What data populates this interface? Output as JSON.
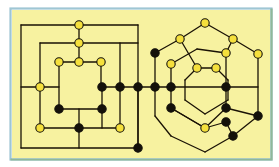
{
  "figure": {
    "background_color": "#f7f2a0",
    "outer_background_color": "#ffffff",
    "border_top_color": "#9fc6d4",
    "border_left_color": "#9fc6d4",
    "border_right_color": "#8fb89a",
    "border_bottom_color": "#8fb89a",
    "edge_color": "#1a1205",
    "edge_width": 1.3,
    "node_open_fill": "#f5e03c",
    "node_filled_fill": "#14110a",
    "node_stroke": "#14110a",
    "node_radius": 4.2,
    "node_stroke_width": 1.1,
    "plot_area": {
      "x": 12,
      "y": 10,
      "width": 258,
      "height": 148
    }
  },
  "chart_data": {
    "type": "diagram",
    "legend": [
      {
        "key": "open",
        "label": "open vertex",
        "color": "#f5e03c"
      },
      {
        "key": "filled",
        "label": "filled vertex",
        "color": "#14110a"
      }
    ],
    "graphs": [
      {
        "name": "left-square-graph",
        "shape": "nested-squares",
        "node_count": 19,
        "edge_count": 24
      },
      {
        "name": "right-hexagon-graph",
        "shape": "nested-hexagons",
        "node_count": 24,
        "edge_count": 29
      }
    ],
    "nodes": [
      {
        "id": "L1",
        "x": 79,
        "y": 25,
        "state": "open"
      },
      {
        "id": "L2",
        "x": 79,
        "y": 43,
        "state": "open"
      },
      {
        "id": "L3",
        "x": 59,
        "y": 62,
        "state": "open"
      },
      {
        "id": "L4",
        "x": 79,
        "y": 62,
        "state": "open"
      },
      {
        "id": "L5",
        "x": 101,
        "y": 62,
        "state": "open"
      },
      {
        "id": "L6",
        "x": 40,
        "y": 87,
        "state": "open"
      },
      {
        "id": "L7",
        "x": 102,
        "y": 87,
        "state": "filled"
      },
      {
        "id": "L8",
        "x": 120,
        "y": 87,
        "state": "filled"
      },
      {
        "id": "L9",
        "x": 138,
        "y": 87,
        "state": "filled"
      },
      {
        "id": "L10",
        "x": 59,
        "y": 109,
        "state": "filled"
      },
      {
        "id": "L11",
        "x": 102,
        "y": 109,
        "state": "filled"
      },
      {
        "id": "L12",
        "x": 40,
        "y": 128,
        "state": "open"
      },
      {
        "id": "L13",
        "x": 79,
        "y": 128,
        "state": "filled"
      },
      {
        "id": "L14",
        "x": 120,
        "y": 128,
        "state": "open"
      },
      {
        "id": "L15",
        "x": 138,
        "y": 148,
        "state": "filled"
      },
      {
        "id": "R1",
        "x": 155,
        "y": 87,
        "state": "filled"
      },
      {
        "id": "R2",
        "x": 205,
        "y": 23,
        "state": "open"
      },
      {
        "id": "R3",
        "x": 180,
        "y": 39,
        "state": "open"
      },
      {
        "id": "R4",
        "x": 233,
        "y": 39,
        "state": "open"
      },
      {
        "id": "R5",
        "x": 155,
        "y": 53,
        "state": "filled"
      },
      {
        "id": "R6",
        "x": 226,
        "y": 53,
        "state": "open"
      },
      {
        "id": "R7",
        "x": 258,
        "y": 54,
        "state": "open"
      },
      {
        "id": "R8",
        "x": 171,
        "y": 64,
        "state": "open"
      },
      {
        "id": "R9",
        "x": 197,
        "y": 68,
        "state": "open"
      },
      {
        "id": "R10",
        "x": 216,
        "y": 68,
        "state": "open"
      },
      {
        "id": "R11",
        "x": 171,
        "y": 87,
        "state": "filled"
      },
      {
        "id": "R12",
        "x": 226,
        "y": 87,
        "state": "filled"
      },
      {
        "id": "R13",
        "x": 171,
        "y": 108,
        "state": "filled"
      },
      {
        "id": "R14",
        "x": 226,
        "y": 108,
        "state": "filled"
      },
      {
        "id": "R15",
        "x": 258,
        "y": 116,
        "state": "filled"
      },
      {
        "id": "R16",
        "x": 205,
        "y": 128,
        "state": "open"
      },
      {
        "id": "R17",
        "x": 226,
        "y": 122,
        "state": "filled"
      },
      {
        "id": "R18",
        "x": 233,
        "y": 136,
        "state": "filled"
      }
    ]
  }
}
